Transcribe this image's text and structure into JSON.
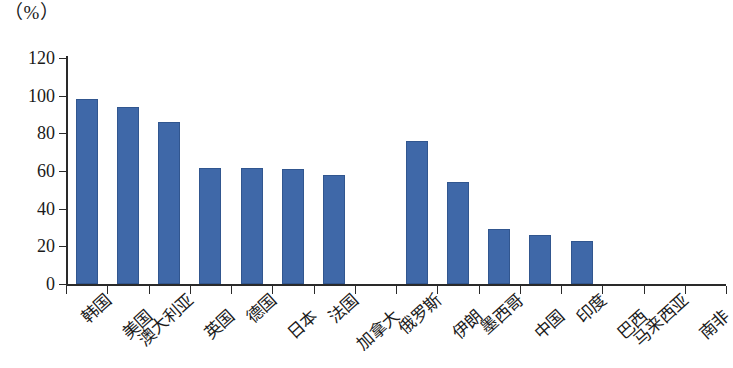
{
  "chart_data": {
    "type": "bar",
    "title": "",
    "subtitle": "",
    "xlabel": "",
    "ylabel": "",
    "unit_label": "（%）",
    "ylim": [
      0,
      120
    ],
    "ytick_values": [
      0,
      20,
      40,
      60,
      80,
      100,
      120
    ],
    "ytick_labels": [
      "0",
      "20",
      "40",
      "60",
      "80",
      "100",
      "120"
    ],
    "grid": false,
    "legend": "none",
    "bar_color": "#3f68a8",
    "axis_color": "#2a2a2a",
    "categories": [
      "韩国",
      "美国",
      "澳大利亚",
      "英国",
      "德国",
      "日本",
      "法国",
      "加拿大",
      "俄罗斯",
      "伊朗",
      "墨西哥",
      "中国",
      "印度",
      "巴西",
      "马来西亚",
      "南非"
    ],
    "values": [
      98,
      94,
      86,
      61.5,
      61.5,
      61,
      58,
      0,
      76,
      54,
      29,
      26,
      23,
      0,
      0,
      0
    ]
  }
}
